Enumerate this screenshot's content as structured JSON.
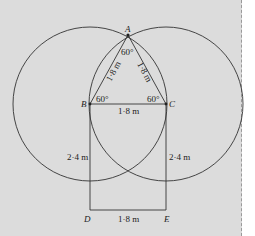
{
  "diagram": {
    "points": {
      "A": {
        "label": "A",
        "x": 128,
        "y": 35
      },
      "B": {
        "label": "B",
        "x": 90,
        "y": 104
      },
      "C": {
        "label": "C",
        "x": 166,
        "y": 104
      },
      "D": {
        "label": "D",
        "x": 90,
        "y": 210
      },
      "E": {
        "label": "E",
        "x": 166,
        "y": 210
      }
    },
    "angles": {
      "A": "60°",
      "B": "60°",
      "C": "60°"
    },
    "lengths": {
      "AB": "1·8 m",
      "AC": "1·8 m",
      "BC": "1·8 m",
      "BD": "2·4 m",
      "CE": "2·4 m",
      "DE": "1·8 m"
    },
    "colors": {
      "background": "#dcdcdc",
      "line": "#333333"
    }
  }
}
